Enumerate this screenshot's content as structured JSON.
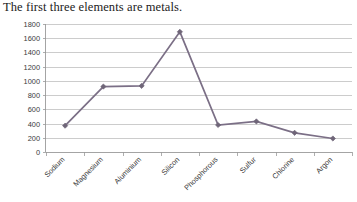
{
  "chart_data": {
    "type": "line",
    "title": "The first three elements are metals.",
    "xlabel": "",
    "ylabel": "",
    "categories": [
      "Sodium",
      "Magnesium",
      "Aluminium",
      "Silicon",
      "Phosphorous",
      "Sulfur",
      "Chlorine",
      "Argon"
    ],
    "values": [
      370,
      920,
      930,
      1690,
      380,
      430,
      270,
      190
    ],
    "series": [
      {
        "name": "Melting point",
        "values": [
          370,
          920,
          930,
          1690,
          380,
          430,
          270,
          190
        ]
      }
    ],
    "ylim": [
      0,
      1800
    ],
    "ytick_step": 200,
    "ytick_labels": [
      "0",
      "200",
      "400",
      "600",
      "800",
      "1000",
      "1200",
      "1400",
      "1600",
      "1800"
    ],
    "grid": true,
    "grid_axis": "y",
    "legend": false,
    "legend_position": "none",
    "markers": true,
    "marker_shape": "diamond",
    "xtick_rotation": 45,
    "colors": {
      "line": "#7b6f86",
      "marker": "#6f6578",
      "gridline": "#b6b6b6",
      "axis": "#9a9a9a",
      "text": "#3b3b3b",
      "title": "#1b1b1b",
      "background": "#ffffff"
    }
  }
}
